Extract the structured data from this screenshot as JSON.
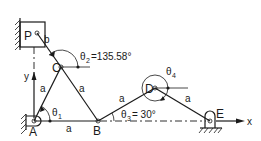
{
  "diagram": {
    "type": "planar linkage mechanism",
    "points": {
      "P": "P",
      "C": "C",
      "A": "A",
      "B": "B",
      "D": "D",
      "E": "E"
    },
    "links": {
      "PC": "b",
      "AC": "a",
      "CB": "a",
      "AB": "a",
      "BD": "a",
      "DE": "a"
    },
    "angles": {
      "theta1": {
        "symbol": "θ",
        "sub": "1",
        "value": ""
      },
      "theta2": {
        "symbol": "θ",
        "sub": "2",
        "value": "=135.58°"
      },
      "theta3": {
        "symbol": "θ",
        "sub": "3",
        "value": "= 30°"
      },
      "theta4": {
        "symbol": "θ",
        "sub": "4",
        "value": ""
      }
    },
    "axes": {
      "x": "x",
      "y": "y"
    },
    "colors": {
      "ink": "#1a1a1a",
      "background": "#ffffff"
    }
  }
}
